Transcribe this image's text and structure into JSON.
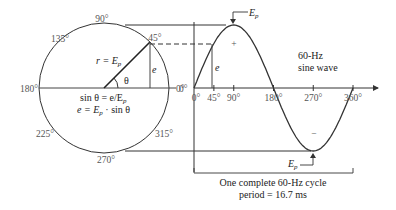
{
  "phasor_circle": {
    "angle_labels": [
      "90°",
      "135°",
      "45°",
      "180°",
      "0°",
      "225°",
      "315°",
      "270°"
    ],
    "radius_label": "r = E",
    "radius_sub": "p",
    "theta_label": "θ",
    "opposite_label": "e",
    "formula_1": "sin θ = e/E",
    "formula_1_sub": "p",
    "formula_2_a": "e = E",
    "formula_2_sub": "p",
    "formula_2_b": " · sin θ",
    "phasor_angle_deg": 45
  },
  "sine_wave": {
    "axis_ticks": [
      "0°",
      "45°",
      "90°",
      "180°",
      "270°",
      "360°"
    ],
    "origin_label": "0°",
    "peak_label": "E",
    "peak_sub": "p",
    "trough_label": "E",
    "trough_sub": "p",
    "plus_sign": "+",
    "minus_sign": "−",
    "instant_label": "e",
    "caption_line1": "60-Hz",
    "caption_line2": "sine wave",
    "cycle_line1": "One complete 60-Hz cycle",
    "cycle_line2": "period = 16.7 ms"
  },
  "chart_data": {
    "type": "line",
    "title": "60-Hz sine wave",
    "xlabel": "",
    "ylabel": "",
    "x": [
      0,
      45,
      90,
      135,
      180,
      225,
      270,
      315,
      360
    ],
    "series": [
      {
        "name": "e = Ep · sin θ",
        "values": [
          0,
          0.707,
          1,
          0.707,
          0,
          -0.707,
          -1,
          -0.707,
          0
        ]
      }
    ],
    "x_tick_labels": [
      "0°",
      "45°",
      "90°",
      "180°",
      "270°",
      "360°"
    ],
    "xlim": [
      0,
      360
    ],
    "ylim": [
      -1,
      1
    ],
    "frequency_hz": 60,
    "period_ms": 16.7
  }
}
